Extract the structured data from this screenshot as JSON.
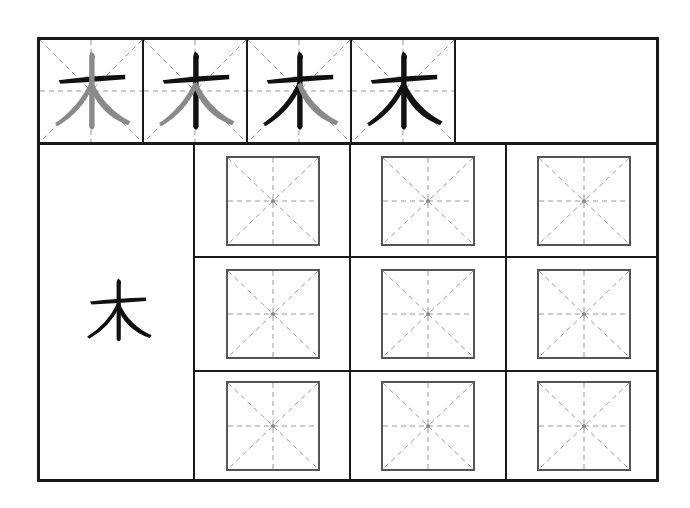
{
  "worksheet": {
    "character": "木",
    "stroke_order": {
      "steps": [
        {
          "step": 1,
          "highlighted_strokes": [
            "horizontal"
          ]
        },
        {
          "step": 2,
          "highlighted_strokes": [
            "horizontal",
            "vertical"
          ]
        },
        {
          "step": 3,
          "highlighted_strokes": [
            "horizontal",
            "vertical",
            "left-falling"
          ]
        },
        {
          "step": 4,
          "highlighted_strokes": [
            "horizontal",
            "vertical",
            "left-falling",
            "right-falling"
          ]
        }
      ]
    },
    "practice_grid": {
      "rows": 3,
      "cols": 3,
      "guide": "mi-zi-ge"
    },
    "colors": {
      "ink": "#111111",
      "ghost": "#8a8a8a",
      "guide": "#999999",
      "border": "#1a1a1a"
    }
  }
}
